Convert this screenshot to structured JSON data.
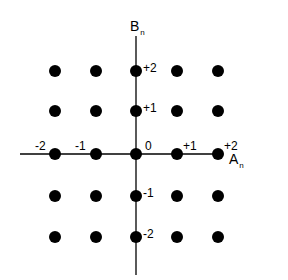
{
  "diagram": {
    "type": "2D integer lattice / constellation",
    "axes": {
      "horizontal": {
        "label": "A",
        "subscript": "n"
      },
      "vertical": {
        "label": "B",
        "subscript": "n"
      }
    },
    "horizontal_ticks": [
      "-2",
      "-1",
      "0",
      "+1",
      "+2"
    ],
    "vertical_ticks": [
      "+2",
      "+1",
      "-1",
      "-2"
    ],
    "grid_values": [
      -2,
      -1,
      0,
      1,
      2
    ],
    "point_count": 25,
    "colors": {
      "points": "#000000",
      "axes": "#000000",
      "background": "#ffffff"
    }
  }
}
